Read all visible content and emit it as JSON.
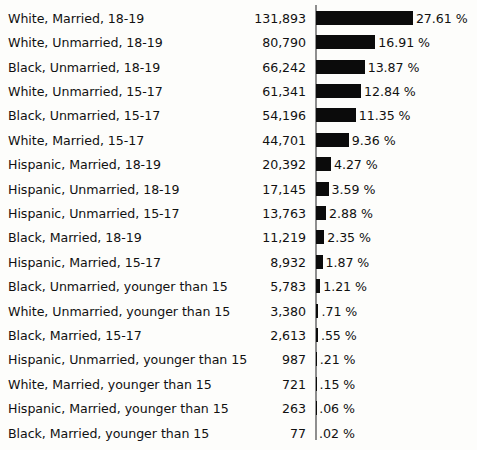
{
  "chart_data": {
    "type": "bar",
    "title": "",
    "subtitle": "",
    "xlabel": "",
    "ylabel": "",
    "orientation": "horizontal",
    "grid": false,
    "legend": null,
    "axis_line_at_zero": true,
    "value_unit": "%",
    "percent_suffix": "%",
    "px_per_percent": 3.51,
    "categories": [
      "White, Married, 18-19",
      "White, Unmarried, 18-19",
      "Black, Unmarried, 18-19",
      "White, Unmarried, 15-17",
      "Black, Unmarried, 15-17",
      "White, Married, 15-17",
      "Hispanic, Married, 18-19",
      "Hispanic, Unmarried, 18-19",
      "Hispanic, Unmarried, 15-17",
      "Black, Married, 18-19",
      "Hispanic, Married, 15-17",
      "Black, Unmarried, younger than 15",
      "White, Unmarried, younger than 15",
      "Black, Married, 15-17",
      "Hispanic, Unmarried, younger than 15",
      "White, Married, younger than 15",
      "Hispanic, Married, younger than 15",
      "Black, Married, younger than 15"
    ],
    "counts": [
      "131,893",
      "80,790",
      "66,242",
      "61,341",
      "54,196",
      "44,701",
      "20,392",
      "17,145",
      "13,763",
      "11,219",
      "8,932",
      "5,783",
      "3,380",
      "2,613",
      "987",
      "721",
      "263",
      "77"
    ],
    "counts_numeric": [
      131893,
      80790,
      66242,
      61341,
      54196,
      44701,
      20392,
      17145,
      13763,
      11219,
      8932,
      5783,
      3380,
      2613,
      987,
      721,
      263,
      77
    ],
    "values": [
      27.61,
      16.91,
      13.87,
      12.84,
      11.35,
      9.36,
      4.27,
      3.59,
      2.88,
      2.35,
      1.87,
      1.21,
      0.71,
      0.55,
      0.21,
      0.15,
      0.06,
      0.02
    ],
    "percent_labels": [
      "27.61 %",
      "16.91 %",
      "13.87 %",
      "12.84 %",
      "11.35 %",
      "9.36 %",
      "4.27 %",
      "3.59 %",
      "2.88 %",
      "2.35 %",
      "1.87 %",
      "1.21 %",
      ".71 %",
      ".55 %",
      ".21 %",
      ".15 %",
      ".06 %",
      ".02 %"
    ],
    "xlim": [
      0,
      27.61
    ],
    "bar_color": "#0b0b0b",
    "axis_color": "#8e8e8e",
    "text_color": "#111111",
    "background_color": "#fdfdfb"
  }
}
